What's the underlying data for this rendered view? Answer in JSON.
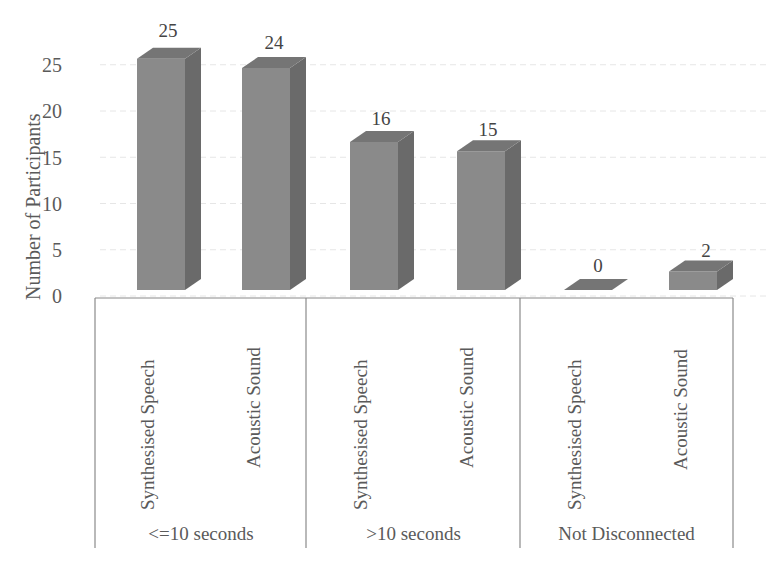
{
  "chart_data": {
    "type": "bar",
    "style": "3d-column",
    "title": "",
    "xlabel": "",
    "ylabel": "Number of Participants",
    "ylim": [
      0,
      25
    ],
    "yticks": [
      0,
      5,
      10,
      15,
      20,
      25
    ],
    "grid": true,
    "legend": null,
    "groups": [
      {
        "label": "<=10 seconds",
        "bars": [
          {
            "category": "Synthesised Speech",
            "value": 25
          },
          {
            "category": "Acoustic Sound",
            "value": 24
          }
        ]
      },
      {
        "label": ">10 seconds",
        "bars": [
          {
            "category": "Synthesised Speech",
            "value": 16
          },
          {
            "category": "Acoustic Sound",
            "value": 15
          }
        ]
      },
      {
        "label": "Not Disconnected",
        "bars": [
          {
            "category": "Synthesised Speech",
            "value": 0
          },
          {
            "category": "Acoustic Sound",
            "value": 2
          }
        ]
      }
    ],
    "categories": [
      "Synthesised Speech",
      "Acoustic Sound",
      "Synthesised Speech",
      "Acoustic Sound",
      "Synthesised Speech",
      "Acoustic Sound"
    ],
    "values": [
      25,
      24,
      16,
      15,
      0,
      2
    ],
    "bar_color": "#8a8a8a",
    "bar_side_color": "#6a6a6a",
    "bar_top_color": "#757575"
  },
  "labels": {
    "ylabel": "Number of Participants",
    "yticks": [
      "25",
      "20",
      "15",
      "10",
      "5",
      "0"
    ],
    "values": [
      "25",
      "24",
      "16",
      "15",
      "0",
      "2"
    ],
    "categories": [
      "Synthesised Speech",
      "Acoustic Sound",
      "Synthesised Speech",
      "Acoustic Sound",
      "Synthesised Speech",
      "Acoustic Sound"
    ],
    "groups": [
      "<=10 seconds",
      ">10 seconds",
      "Not Disconnected"
    ]
  }
}
